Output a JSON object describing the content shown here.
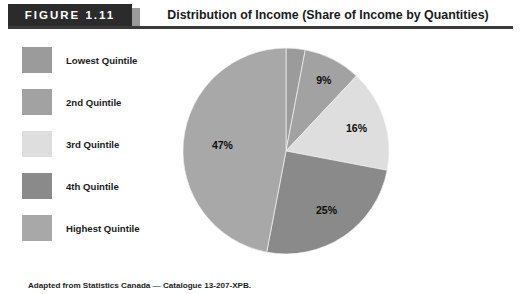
{
  "figure": {
    "tag": "FIGURE 1.11",
    "title": "Distribution of Income (Share of Income by Quantities)",
    "footnote": "Adapted from Statistics Canada — Catalogue 13-207-XPB."
  },
  "legend": {
    "items": [
      {
        "label": "Lowest Quintile",
        "color": "#9b9b9b"
      },
      {
        "label": "2nd Quintile",
        "color": "#a2a2a2"
      },
      {
        "label": "3rd Quintile",
        "color": "#dedede"
      },
      {
        "label": "4th Quintile",
        "color": "#8a8a8a"
      },
      {
        "label": "Highest Quintile",
        "color": "#a8a8a8"
      }
    ]
  },
  "chart_data": {
    "type": "pie",
    "title": "Distribution of Income (Share of Income by Quantities)",
    "unit": "percent",
    "start_angle_deg": 0,
    "direction": "clockwise",
    "legend_position": "left",
    "grid": false,
    "categories": [
      "Lowest Quintile",
      "2nd Quintile",
      "3rd Quintile",
      "4th Quintile",
      "Highest Quintile"
    ],
    "values": [
      3,
      9,
      16,
      25,
      47
    ],
    "labels": [
      "3%",
      "9%",
      "16%",
      "25%",
      "47%"
    ],
    "colors": [
      "#9b9b9b",
      "#a2a2a2",
      "#dedede",
      "#8a8a8a",
      "#a8a8a8"
    ],
    "slices": [
      {
        "name": "Lowest Quintile",
        "value": 3,
        "label": "3%",
        "color": "#9b9b9b"
      },
      {
        "name": "2nd Quintile",
        "value": 9,
        "label": "9%",
        "color": "#a2a2a2"
      },
      {
        "name": "3rd Quintile",
        "value": 16,
        "label": "16%",
        "color": "#dedede"
      },
      {
        "name": "4th Quintile",
        "value": 25,
        "label": "25%",
        "color": "#8a8a8a"
      },
      {
        "name": "Highest Quintile",
        "value": 47,
        "label": "47%",
        "color": "#a8a8a8"
      }
    ]
  }
}
